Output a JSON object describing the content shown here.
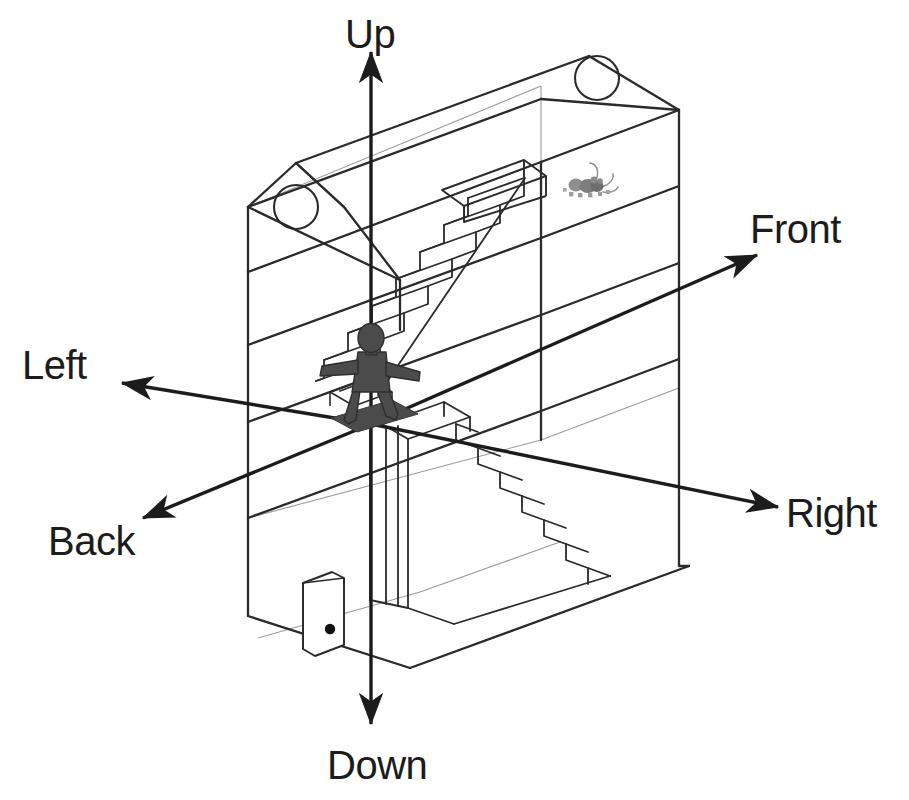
{
  "axes": {
    "origin": {
      "x": 371,
      "y": 424
    },
    "labels": [
      {
        "key": "up",
        "text": "Up",
        "label_x": 345,
        "label_y": 14,
        "tip_x": 371,
        "tip_y": 48,
        "tail_x": 371,
        "tail_y": 424,
        "orientation": "vertical-up"
      },
      {
        "key": "down",
        "text": "Down",
        "label_x": 327,
        "label_y": 748,
        "tip_x": 371,
        "tip_y": 728,
        "tail_x": 371,
        "tail_y": 424,
        "orientation": "vertical-down"
      },
      {
        "key": "left",
        "text": "Left",
        "label_x": 22,
        "label_y": 347,
        "tip_x": 118,
        "tip_y": 382,
        "tail_x": 371,
        "tail_y": 424,
        "orientation": "diagonal-upleft"
      },
      {
        "key": "right",
        "text": "Right",
        "label_x": 786,
        "label_y": 498,
        "tip_x": 782,
        "tip_y": 508,
        "tail_x": 371,
        "tail_y": 424,
        "orientation": "diagonal-downright"
      },
      {
        "key": "front",
        "text": "Front",
        "label_x": 752,
        "label_y": 213,
        "tip_x": 761,
        "tip_y": 252,
        "tail_x": 371,
        "tail_y": 424,
        "orientation": "diagonal-upright"
      },
      {
        "key": "back",
        "text": "Back",
        "label_x": 48,
        "label_y": 526,
        "tip_x": 139,
        "tip_y": 521,
        "tail_x": 371,
        "tail_y": 424,
        "orientation": "diagonal-downleft"
      }
    ]
  },
  "house": {
    "floors": [
      {
        "key": "attic",
        "name": "Attic",
        "contents": [
          "round-window-left",
          "round-window-right",
          "mouse",
          "stair-opening"
        ]
      },
      {
        "key": "middle",
        "name": "Middle floor",
        "contents": [
          "person",
          "upper-staircase-bottom",
          "lower-staircase-top"
        ]
      },
      {
        "key": "ground",
        "name": "Ground floor",
        "contents": [
          "door",
          "lower-staircase"
        ]
      }
    ],
    "features": {
      "round_window_left": {
        "cx": 296,
        "cy": 207,
        "r": 22
      },
      "round_window_right": {
        "cx": 597,
        "cy": 78,
        "r": 22
      },
      "door": {
        "x": 303,
        "y": 583,
        "w": 40,
        "h": 66,
        "knob_x": 330,
        "knob_y": 629,
        "knob_r": 5
      },
      "upper_staircase_steps": 12,
      "lower_staircase_steps": 8
    }
  },
  "figure": {
    "name": "person",
    "pose": "standing with arms outstretched",
    "feet_x": 371,
    "feet_y": 424,
    "height_px": 90
  },
  "mouse": {
    "name": "mouse",
    "x": 590,
    "y": 186
  },
  "colors": {
    "background": "#ffffff",
    "axis": "#1c1c1c",
    "label_text": "#1c1c1c",
    "outline_heavy": "#2b2b2b",
    "outline_light": "#8f8f8f",
    "figure_fill": "#4b4b4b",
    "figure_outline": "#2e2e2e",
    "mouse_fill": "#9a9a9a",
    "mouse_dark": "#6e6e6e",
    "knob": "#101010"
  }
}
